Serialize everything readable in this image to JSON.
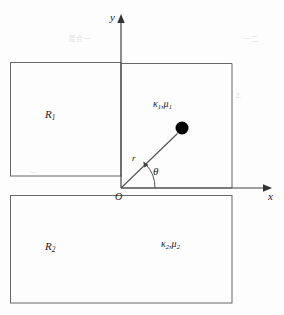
{
  "figure": {
    "type": "physics-geometry-diagram",
    "background_color": "#fdfdfd",
    "line_color": "#555555",
    "text_color": "#1a1a1a",
    "dot_color": "#000000"
  },
  "axes": {
    "x_label": "x",
    "y_label": "y",
    "origin_label": "O",
    "origin": {
      "x": 121,
      "y": 188
    },
    "x_axis": {
      "from_x": 121,
      "to_x": 271,
      "y": 188,
      "arrow": "right"
    },
    "y_axis": {
      "x": 121,
      "from_y": 188,
      "to_y": 14,
      "arrow": "up"
    }
  },
  "regions": [
    {
      "name": "region-1",
      "label": "R",
      "subscript": "1",
      "rect": {
        "x": 10,
        "y": 62,
        "width": 111,
        "height": 114
      },
      "label_pos": {
        "x": 47,
        "y": 116
      }
    },
    {
      "name": "region-2",
      "label": "R",
      "subscript": "2",
      "rect": {
        "x": 10,
        "y": 195,
        "width": 222,
        "height": 108
      },
      "label_pos": {
        "x": 47,
        "y": 248
      }
    },
    {
      "name": "region-1-upper-right",
      "rect": {
        "x": 121,
        "y": 63,
        "width": 111,
        "height": 125
      }
    }
  ],
  "material_labels": [
    {
      "name": "material-upper",
      "kappa": "κ",
      "kappa_sub": "1",
      "separator": ",",
      "mu": "μ",
      "mu_sub": "1",
      "pos": {
        "x": 155,
        "y": 105
      }
    },
    {
      "name": "material-lower",
      "kappa": "κ",
      "kappa_sub": "2",
      "separator": ",",
      "mu": "μ",
      "mu_sub": "2",
      "pos": {
        "x": 163,
        "y": 245
      }
    }
  ],
  "point_source": {
    "label": "source-dot",
    "center": {
      "x": 182,
      "y": 128
    },
    "radius": 6.5
  },
  "polar": {
    "radius_label": "r",
    "radius_label_pos": {
      "x": 134,
      "y": 159
    },
    "angle_label": "θ",
    "angle_label_pos": {
      "x": 155,
      "y": 172
    },
    "ray": {
      "from_x": 121,
      "from_y": 188,
      "to_x": 177,
      "to_y": 133
    },
    "arc": {
      "radius": 34,
      "start_deg": 0,
      "end_deg": 44
    }
  },
  "artifacts": [
    {
      "text": "混合一",
      "x": 68,
      "y": 40,
      "size": 7
    },
    {
      "text": "一二",
      "x": 243,
      "y": 40,
      "size": 7
    },
    {
      "text": "上",
      "x": 235,
      "y": 95,
      "size": 6
    },
    {
      "text": "一",
      "x": 30,
      "y": 172,
      "size": 6
    }
  ]
}
